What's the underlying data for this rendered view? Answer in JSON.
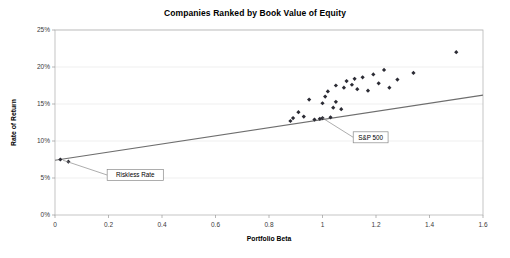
{
  "chart_data": {
    "type": "scatter",
    "title": "Companies Ranked by Book Value of Equity",
    "xlabel": "Portfolio Beta",
    "ylabel": "Rate of Return",
    "xlim": [
      0,
      1.6
    ],
    "ylim": [
      0,
      0.25
    ],
    "grid": true,
    "legend": false,
    "x_ticks": [
      "0",
      "0.2",
      "0.4",
      "0.6",
      "0.8",
      "1",
      "1.2",
      "1.4",
      "1.6"
    ],
    "x_tick_values": [
      0,
      0.2,
      0.4,
      0.6,
      0.8,
      1.0,
      1.2,
      1.4,
      1.6
    ],
    "y_ticks": [
      "0%",
      "5%",
      "10%",
      "15%",
      "20%",
      "25%"
    ],
    "y_tick_values": [
      0,
      0.05,
      0.1,
      0.15,
      0.2,
      0.25
    ],
    "series": [
      {
        "name": "Portfolios",
        "marker": "diamond",
        "color": "#2b2b34",
        "points": [
          [
            0.02,
            0.075
          ],
          [
            0.05,
            0.072
          ],
          [
            0.88,
            0.127
          ],
          [
            0.89,
            0.131
          ],
          [
            0.91,
            0.139
          ],
          [
            0.93,
            0.133
          ],
          [
            0.95,
            0.156
          ],
          [
            0.97,
            0.129
          ],
          [
            0.99,
            0.13
          ],
          [
            1.0,
            0.131
          ],
          [
            1.0,
            0.151
          ],
          [
            1.01,
            0.16
          ],
          [
            1.02,
            0.167
          ],
          [
            1.03,
            0.132
          ],
          [
            1.04,
            0.145
          ],
          [
            1.05,
            0.153
          ],
          [
            1.05,
            0.175
          ],
          [
            1.07,
            0.143
          ],
          [
            1.08,
            0.172
          ],
          [
            1.09,
            0.181
          ],
          [
            1.11,
            0.176
          ],
          [
            1.12,
            0.184
          ],
          [
            1.13,
            0.17
          ],
          [
            1.15,
            0.186
          ],
          [
            1.17,
            0.168
          ],
          [
            1.19,
            0.19
          ],
          [
            1.21,
            0.178
          ],
          [
            1.23,
            0.196
          ],
          [
            1.25,
            0.172
          ],
          [
            1.28,
            0.183
          ],
          [
            1.34,
            0.192
          ],
          [
            1.5,
            0.22
          ]
        ]
      }
    ],
    "trendline": {
      "name": "Security Market Line",
      "x_start": 0.0,
      "y_start": 0.074,
      "x_end": 1.6,
      "y_end": 0.162,
      "color": "#6e6e6e"
    },
    "annotations": [
      {
        "label": "Riskless Rate",
        "target_x": 0.03,
        "target_y": 0.074,
        "box_x": 0.3,
        "box_y": 0.054
      },
      {
        "label": "S&P 500",
        "target_x": 1.0,
        "target_y": 0.131,
        "box_x": 1.18,
        "box_y": 0.105
      }
    ]
  }
}
